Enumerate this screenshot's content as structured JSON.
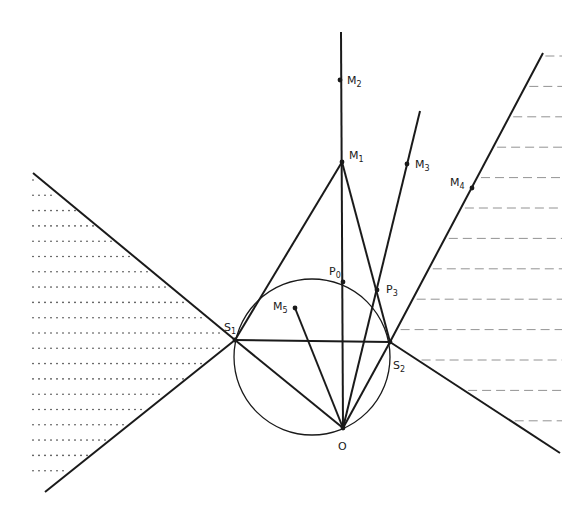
{
  "diagram": {
    "type": "geometric-construction",
    "stroke_color": "#1a1a1a",
    "background": "#ffffff",
    "points": {
      "O": {
        "label": "O",
        "sub": "",
        "x": 343,
        "y": 428
      },
      "S1": {
        "label": "S",
        "sub": "1",
        "x": 235,
        "y": 340
      },
      "S2": {
        "label": "S",
        "sub": "2",
        "x": 390,
        "y": 342
      },
      "M1": {
        "label": "M",
        "sub": "1",
        "x": 342,
        "y": 162
      },
      "M2": {
        "label": "M",
        "sub": "2",
        "x": 340,
        "y": 80
      },
      "M3": {
        "label": "M",
        "sub": "3",
        "x": 407,
        "y": 164
      },
      "M4": {
        "label": "M",
        "sub": "4",
        "x": 472,
        "y": 188
      },
      "M5": {
        "label": "M",
        "sub": "5",
        "x": 295,
        "y": 308
      },
      "P0": {
        "label": "P",
        "sub": "0",
        "x": 343,
        "y": 282
      },
      "P3": {
        "label": "P",
        "sub": "3",
        "x": 377,
        "y": 290
      }
    },
    "circle": {
      "cx": 312,
      "cy": 357,
      "r": 78
    },
    "left_region": {
      "pattern": "dotted",
      "description": "shaded wedge left of S1"
    },
    "right_region": {
      "pattern": "dashed",
      "description": "shaded region right of S2 boundary rays"
    }
  }
}
